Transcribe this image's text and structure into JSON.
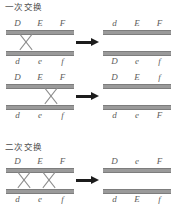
{
  "figure": {
    "sections": [
      {
        "title": "一次交换",
        "rows": [
          {
            "left": {
              "top_alleles": [
                "D",
                "E",
                "F"
              ],
              "bottom_alleles": [
                "d",
                "e",
                "f"
              ],
              "crosses": 1,
              "cross_positions": [
                "between-D-and-E"
              ]
            },
            "arrow": "right-arrow",
            "right": {
              "top_alleles": [
                "d",
                "E",
                "F"
              ],
              "bottom_alleles": [
                "D",
                "e",
                "f"
              ],
              "crosses": 0
            }
          },
          {
            "left": {
              "top_alleles": [
                "D",
                "E",
                "F"
              ],
              "bottom_alleles": [
                "d",
                "e",
                "f"
              ],
              "crosses": 1,
              "cross_positions": [
                "between-E-and-F"
              ]
            },
            "arrow": "right-arrow",
            "right": {
              "top_alleles": [
                "D",
                "E",
                "f"
              ],
              "bottom_alleles": [
                "d",
                "e",
                "F"
              ],
              "crosses": 0
            }
          }
        ]
      },
      {
        "title": "二次交换",
        "rows": [
          {
            "left": {
              "top_alleles": [
                "D",
                "E",
                "F"
              ],
              "bottom_alleles": [
                "d",
                "e",
                "f"
              ],
              "crosses": 2,
              "cross_positions": [
                "between-D-and-E",
                "between-E-and-F"
              ]
            },
            "arrow": "right-arrow",
            "right": {
              "top_alleles": [
                "D",
                "e",
                "F"
              ],
              "bottom_alleles": [
                "d",
                "E",
                "f"
              ],
              "crosses": 0
            }
          }
        ]
      }
    ],
    "colors": {
      "bar": "#9a9a9a",
      "bar_edge": "#7d7d7d",
      "cross": "#8c8c8c",
      "arrow": "#1c1c1c",
      "text": "#5d5d5d",
      "background": "#ffffff"
    }
  }
}
